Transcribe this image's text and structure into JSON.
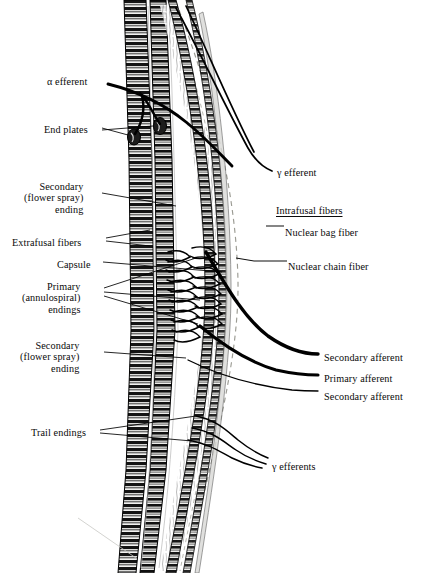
{
  "figure": {
    "background": "#ffffff",
    "ink": "#000000"
  },
  "labels_left": [
    {
      "id": "alpha-efferent",
      "text": "α efferent",
      "x": 47,
      "y": 76,
      "align": "left"
    },
    {
      "id": "end-plates",
      "text": "End plates",
      "x": 44,
      "y": 124,
      "align": "left"
    },
    {
      "id": "secondary-ending-upper",
      "text": "Secondary\n(flower spray)\nending",
      "x": 24,
      "y": 181,
      "align": "left"
    },
    {
      "id": "extrafusal-fibers",
      "text": "Extrafusal fibers",
      "x": 12,
      "y": 237,
      "align": "left"
    },
    {
      "id": "capsule",
      "text": "Capsule",
      "x": 57,
      "y": 259,
      "align": "left"
    },
    {
      "id": "primary-endings",
      "text": "Primary\n(annulospiral)\nendings",
      "x": 22,
      "y": 281,
      "align": "left"
    },
    {
      "id": "secondary-ending-lower",
      "text": "Secondary\n(flower spray)\nending",
      "x": 20,
      "y": 340,
      "align": "left"
    },
    {
      "id": "trail-endings",
      "text": "Trail endings",
      "x": 31,
      "y": 427,
      "align": "left"
    }
  ],
  "labels_right": [
    {
      "id": "gamma-efferent",
      "text": "γ efferent",
      "x": 277,
      "y": 167,
      "heading": false
    },
    {
      "id": "intrafusal-fibers",
      "text": "Intrafusal fibers",
      "x": 276,
      "y": 205,
      "heading": true
    },
    {
      "id": "nuclear-bag-fiber",
      "text": "Nuclear bag fiber",
      "x": 285,
      "y": 227,
      "heading": false
    },
    {
      "id": "nuclear-chain-fiber",
      "text": "Nuclear chain fiber",
      "x": 288,
      "y": 261,
      "heading": false
    },
    {
      "id": "secondary-afferent-1",
      "text": "Secondary afferent",
      "x": 324,
      "y": 352,
      "heading": false
    },
    {
      "id": "primary-afferent",
      "text": "Primary afferent",
      "x": 324,
      "y": 373,
      "heading": false
    },
    {
      "id": "secondary-afferent-2",
      "text": "Secondary afferent",
      "x": 324,
      "y": 391,
      "heading": false
    },
    {
      "id": "gamma-efferents",
      "text": "γ efferents",
      "x": 272,
      "y": 461,
      "heading": false
    }
  ],
  "anatomy": {
    "extrafusal_fibers": "striated skeletal muscle fibers, dark cross-banded, running top to bottom",
    "intrafusal_fibers": "nuclear bag and nuclear chain fibers inside the spindle capsule",
    "capsule": "thin dashed connective-tissue sheath bulging to the right around the equatorial region",
    "primary_endings": "annulospiral coils wrapped around the equator of intrafusal fibers",
    "motor_end_plates": "oval plaques on extrafusal fibers at the alpha efferent terminals",
    "nerve_trunks": "thick curved afferent and efferent nerves leaving toward the right"
  }
}
